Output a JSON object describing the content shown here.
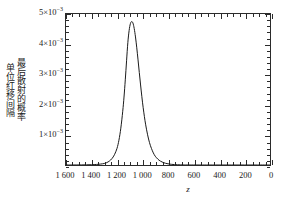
{
  "chart_data": {
    "type": "line",
    "title": "",
    "xlabel": "z",
    "ylabel_lines": [
      "单位红移间隔",
      "最后散射的概率"
    ],
    "xlim": [
      1600,
      0
    ],
    "ylim": [
      0,
      0.005
    ],
    "x_axis_reversed": true,
    "grid": false,
    "legend": null,
    "x_tick_labels": [
      "1 600",
      "1 400",
      "1 200",
      "1 000",
      "800",
      "600",
      "400",
      "200",
      "0"
    ],
    "x_tick_values": [
      1600,
      1400,
      1200,
      1000,
      800,
      600,
      400,
      200,
      0
    ],
    "x_minor_tick_step": 50,
    "y_tick_labels": [
      "1×10⁻³",
      "2×10⁻³",
      "3×10⁻³",
      "4×10⁻³",
      "5×10⁻³"
    ],
    "y_tick_values": [
      0.001,
      0.002,
      0.003,
      0.004,
      0.005
    ],
    "y_minor_tick_step": 0.0002,
    "y_tick_mantissas": [
      "1",
      "2",
      "3",
      "4",
      "5"
    ],
    "y_tick_base": "×10",
    "y_tick_exponent": "−3",
    "peak": {
      "x": 1090,
      "y": 0.00475
    },
    "series": [
      {
        "name": "last scattering visibility function",
        "color": "#1a1a1a",
        "x": [
          1600,
          1560,
          1520,
          1480,
          1440,
          1400,
          1360,
          1330,
          1300,
          1280,
          1260,
          1240,
          1220,
          1200,
          1185,
          1170,
          1155,
          1145,
          1135,
          1125,
          1115,
          1105,
          1095,
          1085,
          1075,
          1065,
          1055,
          1045,
          1035,
          1025,
          1015,
          1005,
          995,
          985,
          975,
          960,
          945,
          930,
          915,
          900,
          880,
          860,
          840,
          820,
          800,
          775,
          750,
          725,
          700,
          675,
          650,
          600,
          550,
          500,
          400,
          300,
          200,
          100,
          0
        ],
        "y": [
          5e-07,
          1e-06,
          1.8e-06,
          3.2e-06,
          5.8e-06,
          1e-05,
          1.85e-05,
          3e-05,
          5e-05,
          8e-05,
          0.00013,
          0.00021,
          0.00034,
          0.00055,
          0.00082,
          0.00122,
          0.00178,
          0.00225,
          0.00282,
          0.00345,
          0.00405,
          0.00445,
          0.00468,
          0.00475,
          0.0047,
          0.00452,
          0.00424,
          0.00388,
          0.00348,
          0.00306,
          0.00265,
          0.00226,
          0.00191,
          0.0016,
          0.00133,
          0.001,
          0.00074,
          0.00055,
          0.0004,
          0.00029,
          0.000195,
          0.00013,
          8.7e-05,
          5.8e-05,
          3.9e-05,
          2.3e-05,
          1.4e-05,
          8.5e-06,
          5e-06,
          3e-06,
          1.8e-06,
          7e-07,
          3e-07,
          1e-07,
          2e-08,
          5e-09,
          1e-09,
          2e-10,
          0.0
        ]
      }
    ]
  },
  "axis": {
    "x_title": "z"
  }
}
